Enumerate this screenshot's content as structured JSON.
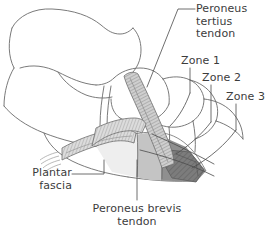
{
  "figure": {
    "background_color": "#ffffff",
    "line_color": "#5a5a5a",
    "text_color": "#3c3c3c"
  },
  "labels": {
    "peroneus_tertius": {
      "name": "peroneus-tertius-tendon",
      "line1": "Peroneus",
      "line2": "tertius",
      "line3": "tendon"
    },
    "zone1": {
      "name": "zone-1",
      "text": "Zone 1"
    },
    "zone2": {
      "name": "zone-2",
      "text": "Zone 2"
    },
    "zone3": {
      "name": "zone-3",
      "text": "Zone 3"
    },
    "plantar_fascia": {
      "name": "plantar-fascia",
      "line1": "Plantar",
      "line2": "fascia"
    },
    "peroneus_brevis": {
      "name": "peroneus-brevis-tendon",
      "line1": "Peroneus brevis",
      "line2": "tendon"
    }
  },
  "zones": {
    "zone1_fill": "#eeeeee",
    "zone2_fill": "#c4c4c4",
    "zone3_fill": "#8f8f8f",
    "zone3_dark_fill": "#6e6e6e"
  },
  "structures": {
    "bone_outline_color": "#6b6b6b",
    "tendon_fill": "#c9c9c9",
    "tendon_stripe": "#8a8a8a",
    "fascia_fill": "#d8d8d8",
    "fascia_stripe": "#9a9a9a",
    "leader_color": "#4a4a4a"
  }
}
